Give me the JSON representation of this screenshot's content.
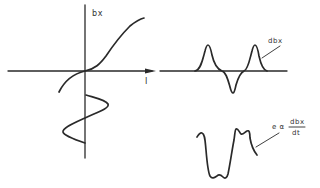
{
  "diagram": {
    "bh_plot": {
      "y_axis_label": "bx",
      "x_axis_label": "I",
      "curve": "magnetization-curve",
      "input": "sinusoidal-current"
    },
    "flux_derivative_plot": {
      "label": "dbx"
    },
    "voltage_plot": {
      "label_prefix": "e α",
      "label_numerator": "dbx",
      "label_denominator": "dt"
    },
    "colors": {
      "ink": "#2a2a2a",
      "background": "#ffffff"
    }
  }
}
